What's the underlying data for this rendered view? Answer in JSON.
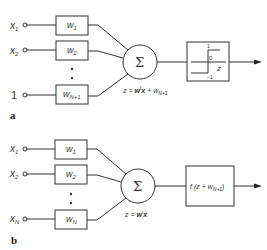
{
  "panel_a": {
    "label": "a",
    "inputs": [
      {
        "name": "x",
        "sub": "1"
      },
      {
        "name": "x",
        "sub": "2"
      },
      {
        "name": "1",
        "sub": ""
      }
    ],
    "weights": [
      {
        "name": "w",
        "sub": "1"
      },
      {
        "name": "w",
        "sub": "2"
      },
      {
        "name": "w",
        "sub": "N+1"
      }
    ],
    "sum_symbol": "Σ",
    "equation": {
      "z": "z = ",
      "w": "w",
      "t": "t",
      "x": "x",
      "plus": " + w",
      "sub": "N+1"
    },
    "activation": {
      "top": "1",
      "zero": "0",
      "bottom": "−1",
      "axis": "z"
    }
  },
  "panel_b": {
    "label": "b",
    "inputs": [
      {
        "name": "x",
        "sub": "1"
      },
      {
        "name": "x",
        "sub": "2"
      },
      {
        "name": "x",
        "sub": "N"
      }
    ],
    "weights": [
      {
        "name": "w",
        "sub": "1"
      },
      {
        "name": "w",
        "sub": "2"
      },
      {
        "name": "w",
        "sub": "N"
      }
    ],
    "sum_symbol": "Σ",
    "equation": {
      "z": "z = ",
      "w": "w",
      "t": "t",
      "x": "x"
    },
    "activation": {
      "f": "f (z + w",
      "sub": "N+1",
      "close": ")"
    }
  }
}
